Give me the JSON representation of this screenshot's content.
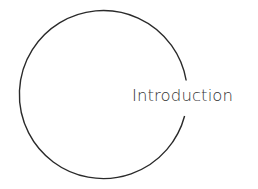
{
  "diagram": {
    "shape": "open-circle",
    "stroke_color": "#2a2a2a",
    "background": "#ffffff",
    "label": "Introduction",
    "label_color": "#333333"
  }
}
